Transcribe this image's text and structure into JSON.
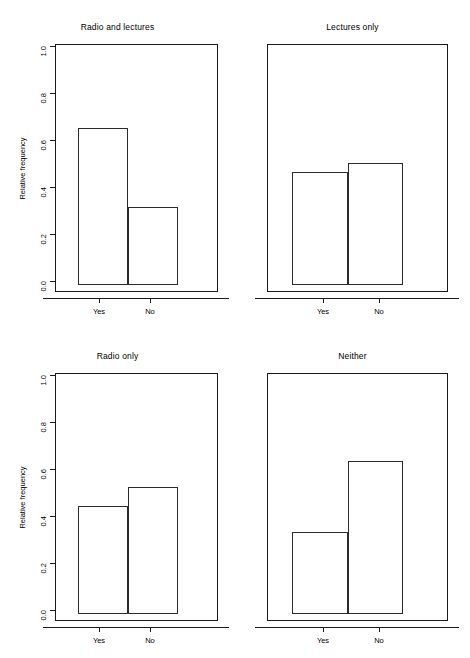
{
  "figure": {
    "layout": "2x2 grid of bar charts",
    "axis_title_y": "Relative frequency",
    "categories": [
      "Yes",
      "No"
    ],
    "y_ticks": [
      "0.0",
      "0.2",
      "0.4",
      "0.6",
      "0.8",
      "1.0"
    ],
    "y_tick_values": [
      0.0,
      0.2,
      0.4,
      0.6,
      0.8,
      1.0
    ]
  },
  "panels": [
    {
      "title": "Radio and lectures",
      "show_y_axis": true,
      "values": [
        0.67,
        0.33
      ]
    },
    {
      "title": "Lectures only",
      "show_y_axis": false,
      "values": [
        0.48,
        0.52
      ]
    },
    {
      "title": "Radio only",
      "show_y_axis": true,
      "values": [
        0.46,
        0.54
      ]
    },
    {
      "title": "Neither",
      "show_y_axis": false,
      "values": [
        0.35,
        0.65
      ]
    }
  ],
  "chart_data": {
    "type": "bar",
    "title": "",
    "subtitle": "",
    "xlabel": "",
    "ylabel": "Relative frequency",
    "ylim": [
      0.0,
      1.0
    ],
    "yticks": [
      0.0,
      0.2,
      0.4,
      0.6,
      0.8,
      1.0
    ],
    "ytick_labels": [
      "0.0",
      "0.2",
      "0.4",
      "0.6",
      "0.8",
      "1.0"
    ],
    "grid": false,
    "legend": false,
    "legend_position": "none",
    "panel_layout": {
      "rows": 2,
      "cols": 2
    },
    "categories": [
      "Yes",
      "No"
    ],
    "panels": [
      {
        "title": "Radio and lectures",
        "position": "top-left",
        "categories": [
          "Yes",
          "No"
        ],
        "values": [
          0.67,
          0.33
        ],
        "y_axis_shown": true
      },
      {
        "title": "Lectures only",
        "position": "top-right",
        "categories": [
          "Yes",
          "No"
        ],
        "values": [
          0.48,
          0.52
        ],
        "y_axis_shown": false
      },
      {
        "title": "Radio only",
        "position": "bottom-left",
        "categories": [
          "Yes",
          "No"
        ],
        "values": [
          0.46,
          0.54
        ],
        "y_axis_shown": true
      },
      {
        "title": "Neither",
        "position": "bottom-right",
        "categories": [
          "Yes",
          "No"
        ],
        "values": [
          0.35,
          0.65
        ],
        "y_axis_shown": false
      }
    ],
    "annotations": [],
    "style": {
      "bar_fill": "none",
      "bar_border": "#2b2b2b",
      "background": "#ffffff",
      "axis_color": "#1a1a1a"
    }
  }
}
